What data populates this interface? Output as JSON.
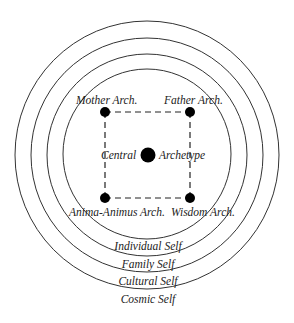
{
  "diagram": {
    "type": "concentric-circles",
    "center": {
      "x": 147,
      "y": 155
    },
    "rings": [
      {
        "name": "Individual Self",
        "rx": 84,
        "ry": 85
      },
      {
        "name": "Family Self",
        "rx": 100,
        "ry": 101
      },
      {
        "name": "Cultural Self",
        "rx": 116,
        "ry": 117
      },
      {
        "name": "Cosmic Self",
        "rx": 132,
        "ry": 134
      }
    ],
    "ring_labels": {
      "individual": "Individual Self",
      "family": "Family Self",
      "cultural": "Cultural Self",
      "cosmic": "Cosmic Self"
    },
    "nodes": {
      "mother": "Mother Arch.",
      "father": "Father Arch.",
      "anima_animus": "Anima-Animus Arch.",
      "wisdom": "Wisdom Arch.",
      "central_left": "Central",
      "central_right": "Archetype"
    },
    "colors": {
      "stroke": "#333333",
      "dot": "#000000"
    }
  }
}
